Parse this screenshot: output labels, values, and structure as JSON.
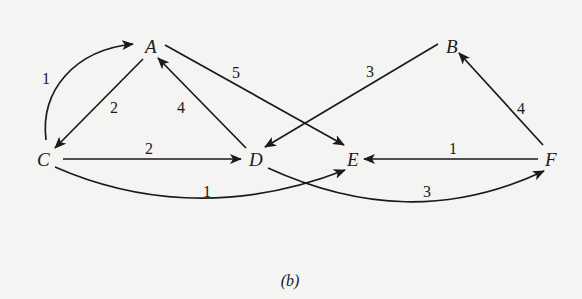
{
  "caption": "(b)",
  "nodes": {
    "A": {
      "label": "A",
      "x": 150,
      "y": 48
    },
    "B": {
      "label": "B",
      "x": 450,
      "y": 48
    },
    "C": {
      "label": "C",
      "x": 45,
      "y": 160
    },
    "D": {
      "label": "D",
      "x": 258,
      "y": 160
    },
    "E": {
      "label": "E",
      "x": 352,
      "y": 160
    },
    "F": {
      "label": "F",
      "x": 550,
      "y": 160
    }
  },
  "edges": [
    {
      "from": "C",
      "to": "A",
      "weight": "1",
      "curved": true
    },
    {
      "from": "A",
      "to": "C",
      "weight": "2",
      "curved": false
    },
    {
      "from": "D",
      "to": "A",
      "weight": "4",
      "curved": false
    },
    {
      "from": "A",
      "to": "E",
      "weight": "5",
      "curved": false
    },
    {
      "from": "B",
      "to": "D",
      "weight": "3",
      "curved": false
    },
    {
      "from": "C",
      "to": "D",
      "weight": "2",
      "curved": false
    },
    {
      "from": "C",
      "to": "E",
      "weight": "1",
      "curved": true
    },
    {
      "from": "D",
      "to": "F",
      "weight": "3",
      "curved": true
    },
    {
      "from": "F",
      "to": "E",
      "weight": "1",
      "curved": false
    },
    {
      "from": "F",
      "to": "B",
      "weight": "4",
      "curved": false
    }
  ]
}
